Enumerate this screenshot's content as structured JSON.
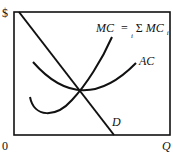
{
  "diagram": {
    "type": "economics-cost-curves",
    "y_axis_label": "$",
    "x_axis_label": "Q",
    "origin_label": "0",
    "curves": [
      {
        "id": "mc",
        "label_main": "MC",
        "label_eq": "=",
        "label_sum": "Σ",
        "label_sum_sub": "i",
        "label_rhs": "MC",
        "label_rhs_sub": "i"
      },
      {
        "id": "ac",
        "label": "AC"
      },
      {
        "id": "d",
        "label": "D"
      }
    ],
    "colors": {
      "line": "#111111",
      "background": "#ffffff"
    }
  }
}
